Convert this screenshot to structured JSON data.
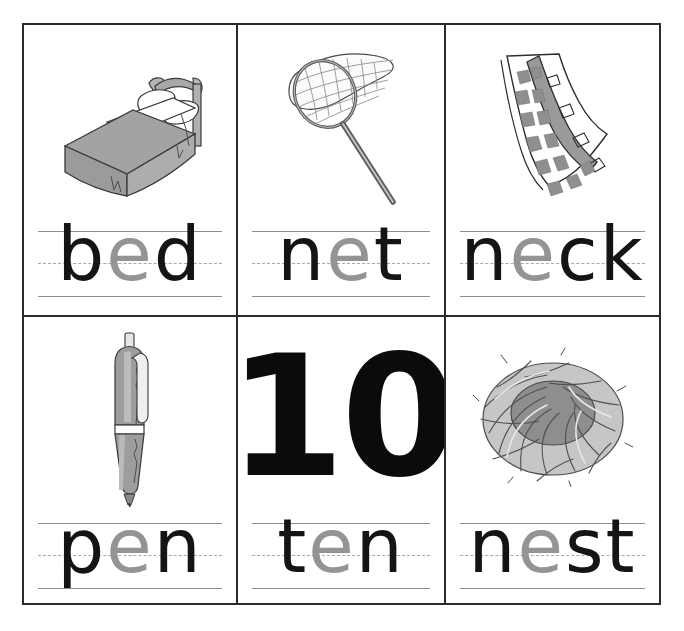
{
  "worksheet": {
    "title": "Short e Picture-Word Cards",
    "vowel_focus": "e",
    "colors": {
      "border": "#2b2b2b",
      "rule_solid": "#8d8d8d",
      "rule_dashed": "#a8a8a8",
      "letter": "#141414",
      "vowel_letter": "#949494",
      "art_gray": "#8e8e8e",
      "art_light_gray": "#c9c9c9",
      "art_outline": "#3a3a3a"
    },
    "grid": {
      "columns": 3,
      "rows": 2
    }
  },
  "cards": [
    {
      "id": "card-bed",
      "word": "bed",
      "image": "bed-illustration",
      "image_label": "bed",
      "letters": [
        {
          "char": "b",
          "highlight": false
        },
        {
          "char": "e",
          "highlight": true
        },
        {
          "char": "d",
          "highlight": false
        }
      ]
    },
    {
      "id": "card-net",
      "word": "net",
      "image": "net-illustration",
      "image_label": "butterfly net",
      "letters": [
        {
          "char": "n",
          "highlight": false
        },
        {
          "char": "e",
          "highlight": true
        },
        {
          "char": "t",
          "highlight": false
        }
      ]
    },
    {
      "id": "card-neck",
      "word": "neck",
      "image": "giraffe-neck-illustration",
      "image_label": "giraffe neck",
      "letters": [
        {
          "char": "n",
          "highlight": false
        },
        {
          "char": "e",
          "highlight": true
        },
        {
          "char": "c",
          "highlight": false
        },
        {
          "char": "k",
          "highlight": false
        }
      ]
    },
    {
      "id": "card-pen",
      "word": "pen",
      "image": "pen-illustration",
      "image_label": "ballpoint pen",
      "letters": [
        {
          "char": "p",
          "highlight": false
        },
        {
          "char": "e",
          "highlight": true
        },
        {
          "char": "n",
          "highlight": false
        }
      ]
    },
    {
      "id": "card-ten",
      "word": "ten",
      "image": "numeral-ten",
      "image_label": "10",
      "numeral": "10",
      "letters": [
        {
          "char": "t",
          "highlight": false
        },
        {
          "char": "e",
          "highlight": true
        },
        {
          "char": "n",
          "highlight": false
        }
      ]
    },
    {
      "id": "card-nest",
      "word": "nest",
      "image": "nest-illustration",
      "image_label": "bird nest",
      "letters": [
        {
          "char": "n",
          "highlight": false
        },
        {
          "char": "e",
          "highlight": true
        },
        {
          "char": "s",
          "highlight": false
        },
        {
          "char": "t",
          "highlight": false
        }
      ]
    }
  ]
}
